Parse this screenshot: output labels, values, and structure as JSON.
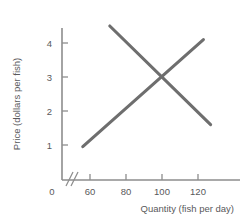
{
  "chart_data": {
    "type": "line",
    "title": "",
    "xlabel": "Quantity (fish per day)",
    "ylabel": "Price (dollars per fish)",
    "xlim": [
      50,
      132
    ],
    "ylim": [
      0,
      4.7
    ],
    "axis_break": true,
    "grid": false,
    "legend": "none",
    "xticks": [
      {
        "value": 0,
        "label": "0"
      },
      {
        "value": 60,
        "label": "60"
      },
      {
        "value": 80,
        "label": "80"
      },
      {
        "value": 100,
        "label": "100"
      },
      {
        "value": 120,
        "label": "120"
      }
    ],
    "yticks": [
      {
        "value": 0,
        "label": "0"
      },
      {
        "value": 1,
        "label": "1"
      },
      {
        "value": 2,
        "label": "2"
      },
      {
        "value": 3,
        "label": "3"
      },
      {
        "value": 4,
        "label": "4"
      }
    ],
    "series": [
      {
        "name": "supply",
        "points": [
          [
            56,
            0.95
          ],
          [
            123,
            4.1
          ]
        ]
      },
      {
        "name": "demand",
        "points": [
          [
            71,
            4.5
          ],
          [
            127,
            1.6
          ]
        ]
      }
    ],
    "equilibrium": {
      "quantity": 100,
      "price": 3
    },
    "colors": {
      "curve": "#6e6e6e",
      "axis": "#8d8d8d",
      "text": "#59595b",
      "background": "#ffffff"
    }
  }
}
